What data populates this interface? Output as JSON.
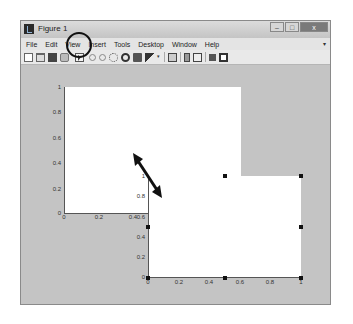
{
  "window": {
    "title": "Figure 1",
    "controls": {
      "minimize": "–",
      "maximize": "□",
      "close": "x"
    }
  },
  "menubar": {
    "items": [
      "File",
      "Edit",
      "View",
      "Insert",
      "Tools",
      "Desktop",
      "Window",
      "Help"
    ],
    "expand_glyph": "▾"
  },
  "toolbar": {
    "buttons": [
      {
        "name": "new-figure",
        "icon": "new-file-icon"
      },
      {
        "name": "open-file",
        "icon": "folder-icon"
      },
      {
        "name": "save-figure",
        "icon": "save-icon"
      },
      {
        "name": "print-figure",
        "icon": "print-icon"
      },
      {
        "name": "edit-plot",
        "icon": "pointer-icon",
        "highlighted": true
      },
      {
        "name": "zoom-in",
        "icon": "zoom-in-icon"
      },
      {
        "name": "zoom-out",
        "icon": "zoom-out-icon"
      },
      {
        "name": "pan",
        "icon": "hand-icon"
      },
      {
        "name": "rotate-3d",
        "icon": "rotate-icon"
      },
      {
        "name": "data-cursor",
        "icon": "data-cursor-icon"
      },
      {
        "name": "brush",
        "icon": "brush-icon"
      },
      {
        "name": "link-plot",
        "icon": "link-icon"
      },
      {
        "name": "insert-colorbar",
        "icon": "colorbar-icon"
      },
      {
        "name": "insert-legend",
        "icon": "legend-icon"
      },
      {
        "name": "hide-plot-tools",
        "icon": "hide-tools-icon"
      },
      {
        "name": "show-plot-tools",
        "icon": "show-tools-icon"
      }
    ],
    "dropdown_glyph": "▾"
  },
  "annotations": {
    "circle_target": "edit-plot pointer button",
    "arrow": "double-headed arrow between axes 1 and axes 2 (resize/move indication)"
  },
  "axes": [
    {
      "id": "axes-1",
      "xticks": [
        "0",
        "0.2",
        "0.4"
      ],
      "yticks": [
        "0",
        "0.2",
        "0.4",
        "0.6",
        "0.8",
        "1"
      ],
      "selected": false
    },
    {
      "id": "axes-2",
      "xticks": [
        "0",
        "0.2",
        "0.4",
        "0.6",
        "0.8",
        "1"
      ],
      "yticks": [
        "0",
        "0.2",
        "0.4",
        "0.6",
        "0.8",
        "1"
      ],
      "selected": true
    }
  ],
  "colors": {
    "figure_background": "#c4c4c4",
    "axes_background": "#ffffff",
    "annotation": "#111111"
  }
}
